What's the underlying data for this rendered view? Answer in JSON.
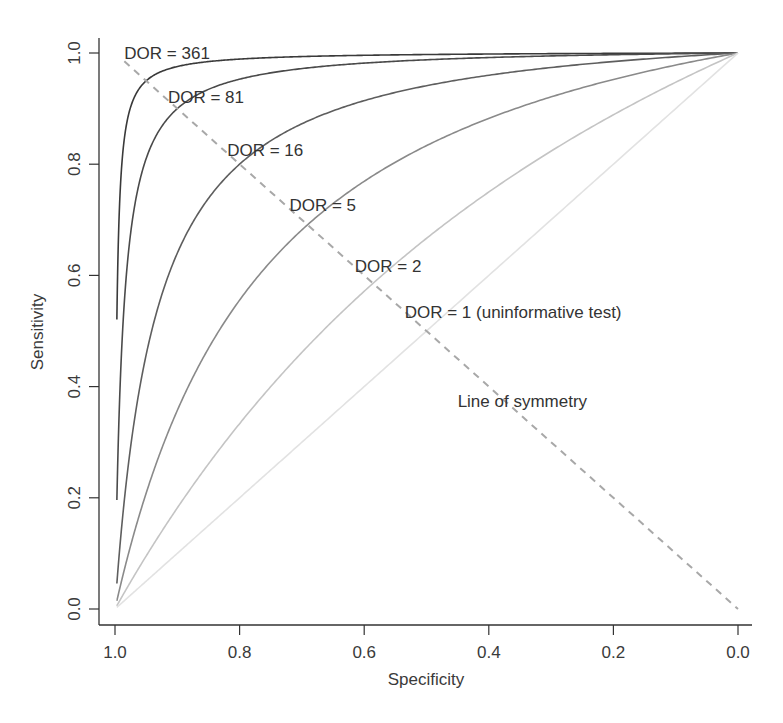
{
  "chart_data": {
    "type": "line",
    "title": "",
    "xlabel": "Specificity",
    "ylabel": "Sensitivity",
    "xlim": [
      1.0,
      0.0
    ],
    "ylim": [
      0.0,
      1.0
    ],
    "x_reversed": true,
    "grid": false,
    "legend": "none",
    "xticks": [
      "1.0",
      "0.8",
      "0.6",
      "0.4",
      "0.2",
      "0.0"
    ],
    "yticks": [
      "0.0",
      "0.2",
      "0.4",
      "0.6",
      "0.8",
      "1.0"
    ],
    "curve_formula": "sensitivity = DOR*(1-spec) / (1 + (DOR-1)*(1-spec))",
    "series": [
      {
        "name": "DOR = 361",
        "dor": 361,
        "color": "#3a3a3a",
        "label": "DOR = 361",
        "label_pos": [
          0.985,
          1.0
        ],
        "points": [
          [
            0.997,
            0.52
          ],
          [
            0.99,
            0.78
          ],
          [
            0.98,
            0.88
          ],
          [
            0.95,
            0.95
          ],
          [
            0.9,
            0.976
          ],
          [
            0.8,
            0.989
          ],
          [
            0.6,
            0.996
          ],
          [
            0.4,
            0.998
          ],
          [
            0.2,
            0.999
          ],
          [
            0.0,
            1.0
          ]
        ]
      },
      {
        "name": "DOR = 81",
        "dor": 81,
        "color": "#4a4a4a",
        "label": "DOR = 81",
        "label_pos": [
          0.915,
          0.92
        ],
        "points": [
          [
            0.997,
            0.2
          ],
          [
            0.99,
            0.45
          ],
          [
            0.98,
            0.62
          ],
          [
            0.95,
            0.81
          ],
          [
            0.9,
            0.9
          ],
          [
            0.8,
            0.953
          ],
          [
            0.6,
            0.982
          ],
          [
            0.4,
            0.992
          ],
          [
            0.2,
            0.997
          ],
          [
            0.0,
            1.0
          ]
        ]
      },
      {
        "name": "DOR = 16",
        "dor": 16,
        "color": "#5e5e5e",
        "label": "DOR = 16",
        "label_pos": [
          0.82,
          0.826
        ],
        "points": [
          [
            0.997,
            0.046
          ],
          [
            0.99,
            0.14
          ],
          [
            0.95,
            0.46
          ],
          [
            0.9,
            0.64
          ],
          [
            0.8,
            0.8
          ],
          [
            0.6,
            0.914
          ],
          [
            0.4,
            0.96
          ],
          [
            0.2,
            0.985
          ],
          [
            0.0,
            1.0
          ]
        ]
      },
      {
        "name": "DOR = 5",
        "dor": 5,
        "color": "#8a8a8a",
        "label": "DOR = 5",
        "label_pos": [
          0.72,
          0.727
        ],
        "points": [
          [
            0.997,
            0.015
          ],
          [
            0.95,
            0.21
          ],
          [
            0.9,
            0.36
          ],
          [
            0.8,
            0.56
          ],
          [
            0.6,
            0.77
          ],
          [
            0.4,
            0.88
          ],
          [
            0.2,
            0.95
          ],
          [
            0.0,
            1.0
          ]
        ]
      },
      {
        "name": "DOR = 2",
        "dor": 2,
        "color": "#c4c4c4",
        "label": "DOR = 2",
        "label_pos": [
          0.615,
          0.617
        ],
        "points": [
          [
            0.997,
            0.006
          ],
          [
            0.9,
            0.18
          ],
          [
            0.8,
            0.33
          ],
          [
            0.6,
            0.57
          ],
          [
            0.4,
            0.75
          ],
          [
            0.2,
            0.89
          ],
          [
            0.0,
            1.0
          ]
        ]
      },
      {
        "name": "DOR = 1 (uninformative test)",
        "dor": 1,
        "color": "#e2e2e2",
        "label": "DOR = 1 (uninformative test)",
        "label_pos": [
          0.535,
          0.535
        ],
        "points": [
          [
            0.997,
            0.003
          ],
          [
            0.8,
            0.2
          ],
          [
            0.6,
            0.4
          ],
          [
            0.4,
            0.6
          ],
          [
            0.2,
            0.8
          ],
          [
            0.0,
            1.0
          ]
        ]
      }
    ],
    "annotations": [
      {
        "text": "Line of symmetry",
        "pos": [
          0.45,
          0.375
        ]
      }
    ],
    "symmetry_line": {
      "from": [
        0.985,
        0.985
      ],
      "to": [
        0.0,
        0.0
      ],
      "style": "dashed",
      "color": "#a8a8a8"
    }
  }
}
